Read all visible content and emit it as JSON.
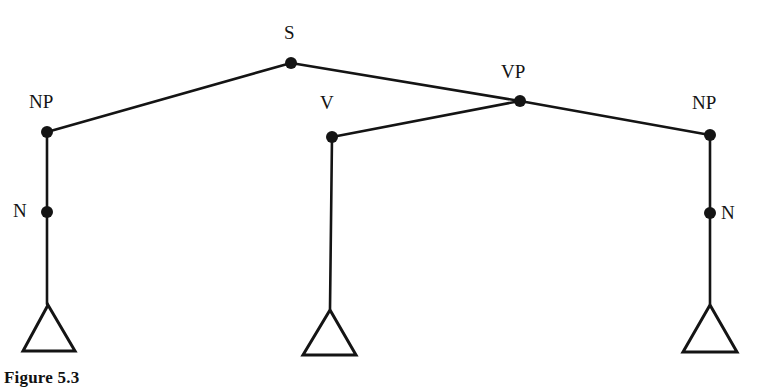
{
  "figure": {
    "caption": "Figure 5.3",
    "background_color": "#ffffff",
    "ink_color": "#141414"
  },
  "tree": {
    "type": "syntax-tree",
    "nodes": [
      {
        "id": "S",
        "label": "S",
        "x": 291,
        "y": 63,
        "label_x": 284,
        "label_y": 23,
        "label_side": "above"
      },
      {
        "id": "NP1",
        "label": "NP",
        "x": 47,
        "y": 132,
        "label_x": 29,
        "label_y": 92,
        "label_side": "above-left"
      },
      {
        "id": "VP",
        "label": "VP",
        "x": 520,
        "y": 101,
        "label_x": 501,
        "label_y": 62,
        "label_side": "above"
      },
      {
        "id": "V",
        "label": "V",
        "x": 332,
        "y": 137,
        "label_x": 320,
        "label_y": 93,
        "label_side": "above-left"
      },
      {
        "id": "NP2",
        "label": "NP",
        "x": 710,
        "y": 135,
        "label_x": 692,
        "label_y": 93,
        "label_side": "above"
      },
      {
        "id": "N1",
        "label": "N",
        "x": 47,
        "y": 212,
        "label_x": 13,
        "label_y": 201,
        "label_side": "left"
      },
      {
        "id": "N2",
        "label": "N",
        "x": 710,
        "y": 213,
        "label_x": 721,
        "label_y": 203,
        "label_side": "right"
      }
    ],
    "edges": [
      {
        "from": "NP1",
        "to": "S",
        "x1": 47,
        "y1": 132,
        "x2": 291,
        "y2": 63
      },
      {
        "from": "S",
        "to": "VP",
        "x1": 291,
        "y1": 63,
        "x2": 520,
        "y2": 101
      },
      {
        "from": "V",
        "to": "VP",
        "x1": 332,
        "y1": 137,
        "x2": 520,
        "y2": 101
      },
      {
        "from": "VP",
        "to": "NP2",
        "x1": 520,
        "y1": 101,
        "x2": 710,
        "y2": 135
      },
      {
        "from": "NP1",
        "to": "N1",
        "x1": 47,
        "y1": 132,
        "x2": 47,
        "y2": 212
      },
      {
        "from": "N1",
        "to": "T1",
        "x1": 47,
        "y1": 212,
        "x2": 47,
        "y2": 304
      },
      {
        "from": "V",
        "to": "T2",
        "x1": 332,
        "y1": 137,
        "x2": 330,
        "y2": 309
      },
      {
        "from": "NP2",
        "to": "N2",
        "x1": 710,
        "y1": 135,
        "x2": 710,
        "y2": 213
      },
      {
        "from": "N2",
        "to": "T3",
        "x1": 710,
        "y1": 213,
        "x2": 710,
        "y2": 304
      }
    ],
    "triangles": [
      {
        "id": "T1",
        "apex_x": 48,
        "apex_y": 305,
        "left_x": 23,
        "right_x": 75,
        "base_y": 351
      },
      {
        "id": "T2",
        "apex_x": 330,
        "apex_y": 310,
        "left_x": 303,
        "right_x": 356,
        "base_y": 355
      },
      {
        "id": "T3",
        "apex_x": 710,
        "apex_y": 305,
        "left_x": 683,
        "right_x": 737,
        "base_y": 352
      }
    ],
    "node_dot_radius": 6,
    "edge_width": 2.6,
    "triangle_stroke_width": 3
  }
}
